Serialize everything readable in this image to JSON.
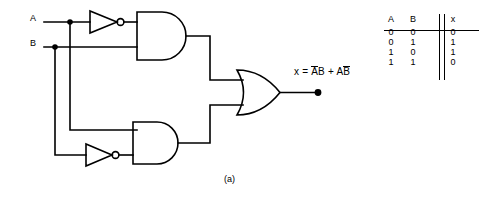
{
  "figure": {
    "caption": "(a)"
  },
  "circuit": {
    "inputs": [
      {
        "name": "input-a",
        "label": "A"
      },
      {
        "name": "input-b",
        "label": "B"
      }
    ],
    "output": {
      "equation_prefix": "x = ",
      "term1_not": "A",
      "term1_plain": "B",
      "plus": " + ",
      "term2_plain": "A",
      "term2_not": "B"
    },
    "gates": [
      {
        "name": "inverter-a",
        "type": "NOT",
        "label": ""
      },
      {
        "name": "inverter-b",
        "type": "NOT",
        "label": ""
      },
      {
        "name": "and-gate-top",
        "type": "AND",
        "label": ""
      },
      {
        "name": "and-gate-bottom",
        "type": "AND",
        "label": ""
      },
      {
        "name": "or-gate",
        "type": "OR",
        "label": ""
      }
    ]
  },
  "truth_table": {
    "headers": [
      "A",
      "B",
      "x"
    ],
    "rows": [
      {
        "a": "0",
        "b": "0",
        "x": "0"
      },
      {
        "a": "0",
        "b": "1",
        "x": "1"
      },
      {
        "a": "1",
        "b": "0",
        "x": "1"
      },
      {
        "a": "1",
        "b": "1",
        "x": "0"
      }
    ]
  },
  "colors": {
    "line": "#000000",
    "background": "#ffffff"
  }
}
